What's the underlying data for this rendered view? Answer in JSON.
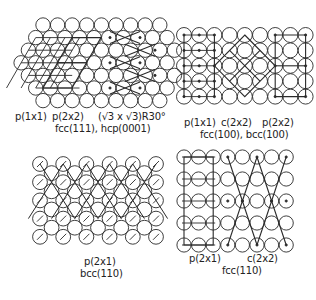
{
  "colors": {
    "ink": "#222222",
    "background": "#ffffff"
  },
  "panels": [
    {
      "id": "fcc111",
      "surface": "fcc(111), hcp(0001)",
      "lattice": "hexagonal",
      "structures": [
        "p(1x1)",
        "p(2x2)",
        "(√3 x √3)R30°"
      ]
    },
    {
      "id": "fcc100",
      "surface": "fcc(100), bcc(100)",
      "lattice": "square",
      "structures": [
        "p(1x1)",
        "c(2x2)",
        "p(2x2)"
      ]
    },
    {
      "id": "bcc110",
      "surface": "bcc(110)",
      "lattice": "centered-rectangular",
      "structures": [
        "p(2x1)"
      ]
    },
    {
      "id": "fcc110",
      "surface": "fcc(110)",
      "lattice": "rectangular",
      "structures": [
        "p(2x1)",
        "c(2x2)"
      ]
    }
  ],
  "labels": {
    "fcc111_p1x1": "p(1x1)",
    "fcc111_p2x2": "p(2x2)",
    "fcc111_sqrt3": "(√3 x √3)R30°",
    "fcc111_surface": "fcc(111), hcp(0001)",
    "fcc100_p1x1": "p(1x1)",
    "fcc100_c2x2": "c(2x2)",
    "fcc100_p2x2": "p(2x2)",
    "fcc100_surface": "fcc(100), bcc(100)",
    "bcc110_p2x1": "p(2x1)",
    "bcc110_surface": "bcc(110)",
    "fcc110_p2x1": "p(2x1)",
    "fcc110_c2x2": "c(2x2)",
    "fcc110_surface": "fcc(110)"
  }
}
